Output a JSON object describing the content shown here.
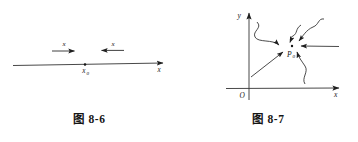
{
  "page": {
    "background_color": "#ffffff",
    "ink_color": "#2b2b2b"
  },
  "figures": [
    {
      "id": "figure-8-6",
      "caption": "图 8-6",
      "description": "number line with x approaching x0 from both sides",
      "axis_label": "x",
      "point_label": "x",
      "point_subscript": "0",
      "left_arrow_label": "x",
      "right_arrow_label": "x",
      "left_arrow_direction": "right",
      "right_arrow_direction": "left"
    },
    {
      "id": "figure-8-7",
      "caption": "图 8-7",
      "description": "xy plane with several paths converging on point P0",
      "y_axis_label": "y",
      "x_axis_label": "x",
      "origin_label": "O",
      "point_label": "P",
      "point_subscript": "0",
      "approach_paths": 5
    }
  ]
}
